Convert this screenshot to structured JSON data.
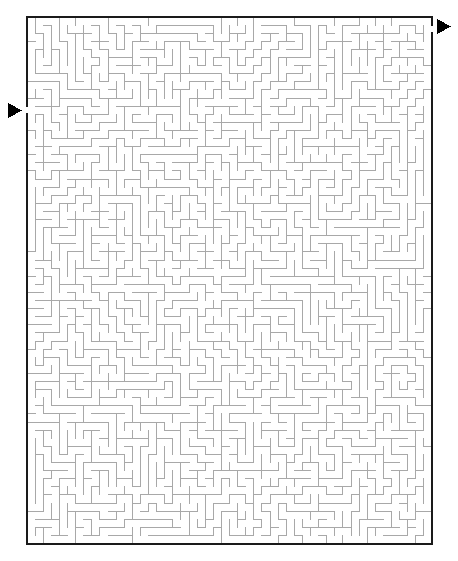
{
  "page": {
    "title": "Maze Puzzle",
    "background_color": "#ffffff",
    "width": 458,
    "height": 561
  },
  "maze": {
    "name": "rectangular-grid-maze",
    "type": "perfect-maze",
    "wall_color": "#a8a8a8",
    "border_color": "#1a1a1a",
    "background_color": "#ffffff",
    "wall_thickness": 1,
    "border_thickness": 2,
    "cell_size": 8.1,
    "columns": 50,
    "rows": 65,
    "origin_x": 27,
    "origin_y": 17,
    "width": 405,
    "height": 526,
    "seed": 20240517
  },
  "entrance": {
    "label": "Entrance",
    "side": "left",
    "arrow_color": "#000000",
    "arrow_direction": "right",
    "arrow_x": 8,
    "arrow_y": 103,
    "arrow_width": 14,
    "arrow_height": 15,
    "gap_row": 11,
    "gap_y": 105,
    "gap_height": 8
  },
  "exit": {
    "label": "Exit",
    "side": "right",
    "arrow_color": "#000000",
    "arrow_direction": "right",
    "arrow_x": 437,
    "arrow_y": 19,
    "arrow_width": 14,
    "arrow_height": 15,
    "gap_row": 1,
    "gap_y": 21,
    "gap_height": 8
  }
}
